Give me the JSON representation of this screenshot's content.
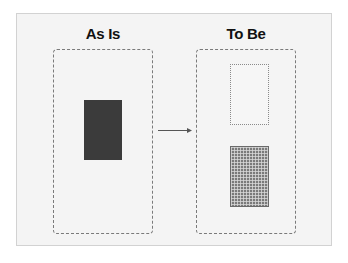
{
  "diagram": {
    "left_panel": {
      "title": "As Is",
      "shape": "solid-dark-rectangle",
      "fill_color": "#3b3b3b"
    },
    "right_panel": {
      "title": "To Be",
      "shapes": [
        {
          "kind": "dotted-outline-rectangle",
          "border_color": "#8a8a8a"
        },
        {
          "kind": "grid-pattern-rectangle",
          "fill_color": "#7a7a7a"
        }
      ]
    },
    "connector": {
      "kind": "arrow",
      "direction": "right",
      "color": "#555555"
    },
    "colors": {
      "card_background": "#f4f4f4",
      "card_border": "#d2d2d2",
      "dashed_border": "#7a7a7a",
      "title_text": "#111111"
    }
  }
}
